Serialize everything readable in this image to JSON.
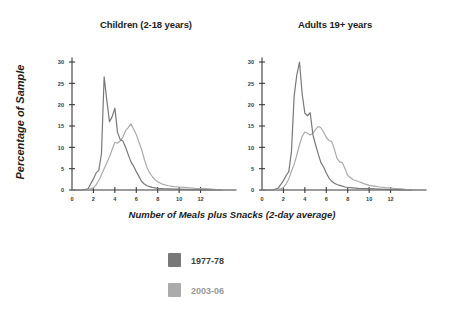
{
  "figure": {
    "background": "#ffffff",
    "axis_label_y": "Percentage of Sample",
    "axis_label_x": "Number of Meals plus Snacks (2-day average)"
  },
  "legend": {
    "position": "bottom-center",
    "entries": [
      {
        "label": "1977-78",
        "color": "#787878",
        "swatch_name": "legend-swatch-1977-78"
      },
      {
        "label": "2003-06",
        "color": "#ababab",
        "swatch_name": "legend-swatch-2003-06"
      }
    ]
  },
  "chart_data": [
    {
      "type": "line",
      "title": "Children (2-18 years)",
      "xlabel": "Number of Meals plus Snacks (2-day average)",
      "ylabel": "Percentage of Sample",
      "xlim": [
        0,
        14
      ],
      "ylim": [
        0,
        30
      ],
      "xticks": [
        0,
        2,
        4,
        6,
        8,
        10,
        12
      ],
      "yticks": [
        0,
        5,
        10,
        15,
        20,
        25,
        30
      ],
      "grid": false,
      "x": [
        0,
        0.5,
        1,
        1.5,
        2,
        2.25,
        2.5,
        2.75,
        3,
        3.25,
        3.5,
        3.75,
        4,
        4.25,
        4.5,
        4.75,
        5,
        5.25,
        5.5,
        5.75,
        6,
        6.25,
        6.5,
        6.75,
        7,
        7.25,
        7.5,
        7.75,
        8,
        8.5,
        9,
        9.5,
        10,
        10.5,
        11,
        11.5,
        12,
        12.5,
        13,
        13.5,
        14
      ],
      "series": [
        {
          "name": "1977-78",
          "color": "#787878",
          "values": [
            0,
            0,
            0,
            0.3,
            2.6,
            4.0,
            4.6,
            8.5,
            26.5,
            21.0,
            16.0,
            17.2,
            19.2,
            13.5,
            11.8,
            11.5,
            10.0,
            8.3,
            6.6,
            5.6,
            4.3,
            3.2,
            2.0,
            1.4,
            1.0,
            0.8,
            0.6,
            0.5,
            0.4,
            0.3,
            0.25,
            0.2,
            0.2,
            0.15,
            0.1,
            0.1,
            0.1,
            0.05,
            0.05,
            0.0,
            0.0
          ]
        },
        {
          "name": "2003-06",
          "color": "#ababab",
          "values": [
            0,
            0,
            0,
            0.1,
            0.5,
            1.2,
            2.3,
            3.6,
            5.0,
            6.4,
            7.8,
            9.5,
            11.2,
            11.0,
            11.5,
            12.4,
            13.9,
            14.6,
            15.5,
            14.3,
            13.0,
            11.2,
            9.5,
            7.2,
            5.3,
            4.0,
            3.1,
            2.4,
            1.9,
            1.3,
            1.0,
            0.8,
            0.7,
            0.6,
            0.5,
            0.4,
            0.35,
            0.3,
            0.2,
            0.1,
            0.0
          ]
        }
      ]
    },
    {
      "type": "line",
      "title": "Adults 19+ years",
      "xlabel": "Number of Meals plus Snacks (2-day average)",
      "ylabel": "Percentage of Sample",
      "xlim": [
        0,
        14
      ],
      "ylim": [
        0,
        30
      ],
      "xticks": [
        0,
        2,
        4,
        6,
        8,
        10,
        12
      ],
      "yticks": [
        0,
        5,
        10,
        15,
        20,
        25,
        30
      ],
      "grid": false,
      "x": [
        0,
        0.5,
        1,
        1.5,
        2,
        2.25,
        2.5,
        2.75,
        3,
        3.25,
        3.5,
        3.75,
        4,
        4.25,
        4.5,
        4.75,
        5,
        5.25,
        5.5,
        5.75,
        6,
        6.25,
        6.5,
        6.75,
        7,
        7.25,
        7.5,
        7.75,
        8,
        8.5,
        9,
        9.5,
        10,
        10.5,
        11,
        11.5,
        12,
        12.5,
        13,
        13.5,
        14
      ],
      "series": [
        {
          "name": "1977-78",
          "color": "#787878",
          "values": [
            0,
            0,
            0,
            0.4,
            2.2,
            3.4,
            4.3,
            9.0,
            22.0,
            27.0,
            30.0,
            22.5,
            18.0,
            17.4,
            18.1,
            13.0,
            10.6,
            8.4,
            6.4,
            5.4,
            4.0,
            2.8,
            2.1,
            1.6,
            1.3,
            1.1,
            0.9,
            0.7,
            0.6,
            0.5,
            0.4,
            0.35,
            0.3,
            0.25,
            0.2,
            0.15,
            0.1,
            0.1,
            0.05,
            0.0,
            0.0
          ]
        },
        {
          "name": "2003-06",
          "color": "#ababab",
          "values": [
            0,
            0,
            0,
            0.1,
            0.6,
            1.4,
            2.6,
            4.4,
            6.0,
            8.2,
            10.6,
            12.6,
            13.6,
            13.3,
            12.9,
            13.3,
            14.2,
            14.9,
            14.6,
            13.6,
            12.3,
            11.6,
            11.4,
            9.6,
            7.4,
            6.6,
            6.4,
            5.0,
            3.4,
            2.4,
            2.0,
            1.5,
            1.1,
            0.9,
            0.7,
            0.55,
            0.45,
            0.35,
            0.25,
            0.1,
            0.0
          ]
        }
      ]
    }
  ]
}
